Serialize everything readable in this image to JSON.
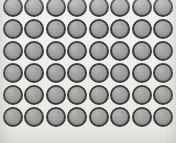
{
  "image": {
    "kind": "photograph",
    "subject": "grid-of-circular-discs",
    "description": "Overhead scanned image of identical gray circular discs arranged in a regular rectangular grid",
    "width_px": 176,
    "height_px": 143
  },
  "canvas": {
    "width": 176,
    "height": 143,
    "background_color": "#f2f2f0",
    "background_color_light": "#f4f4f2",
    "background_color_dark": "#e9e9e6"
  },
  "grid": {
    "columns": 8,
    "rows": 6,
    "total_visible_discs": 48,
    "column_pitch_px": 21.5,
    "row_pitch_px": 22.2,
    "origin_x_px": 3,
    "origin_y_px": -3,
    "top_row_clipped": true,
    "bottom_row_clipped": true,
    "left_margin_px": 3,
    "right_margin_px": 8
  },
  "disc": {
    "label": "circular-disc",
    "diameter_px": 20,
    "fill_color": "#a2a2a0",
    "border_color": "#3b3b3b",
    "border_width_px": 2,
    "highlight_color": "#ffffff",
    "shadow_color": "#000000"
  },
  "discs": [
    {
      "row": 0,
      "col": 0,
      "x": 3,
      "y": -3
    },
    {
      "row": 0,
      "col": 1,
      "x": 24,
      "y": -3
    },
    {
      "row": 0,
      "col": 2,
      "x": 46,
      "y": -3
    },
    {
      "row": 0,
      "col": 3,
      "x": 67,
      "y": -3
    },
    {
      "row": 0,
      "col": 4,
      "x": 89,
      "y": -3
    },
    {
      "row": 0,
      "col": 5,
      "x": 110,
      "y": -3
    },
    {
      "row": 0,
      "col": 6,
      "x": 132,
      "y": -3
    },
    {
      "row": 0,
      "col": 7,
      "x": 153,
      "y": -3
    },
    {
      "row": 1,
      "col": 0,
      "x": 3,
      "y": 19
    },
    {
      "row": 1,
      "col": 1,
      "x": 24,
      "y": 19
    },
    {
      "row": 1,
      "col": 2,
      "x": 46,
      "y": 19
    },
    {
      "row": 1,
      "col": 3,
      "x": 67,
      "y": 19
    },
    {
      "row": 1,
      "col": 4,
      "x": 89,
      "y": 19
    },
    {
      "row": 1,
      "col": 5,
      "x": 110,
      "y": 19
    },
    {
      "row": 1,
      "col": 6,
      "x": 132,
      "y": 19
    },
    {
      "row": 1,
      "col": 7,
      "x": 153,
      "y": 19
    },
    {
      "row": 2,
      "col": 0,
      "x": 3,
      "y": 41
    },
    {
      "row": 2,
      "col": 1,
      "x": 24,
      "y": 41
    },
    {
      "row": 2,
      "col": 2,
      "x": 46,
      "y": 41
    },
    {
      "row": 2,
      "col": 3,
      "x": 67,
      "y": 41
    },
    {
      "row": 2,
      "col": 4,
      "x": 89,
      "y": 41
    },
    {
      "row": 2,
      "col": 5,
      "x": 110,
      "y": 41
    },
    {
      "row": 2,
      "col": 6,
      "x": 132,
      "y": 41
    },
    {
      "row": 2,
      "col": 7,
      "x": 153,
      "y": 41
    },
    {
      "row": 3,
      "col": 0,
      "x": 3,
      "y": 63
    },
    {
      "row": 3,
      "col": 1,
      "x": 24,
      "y": 63
    },
    {
      "row": 3,
      "col": 2,
      "x": 46,
      "y": 63
    },
    {
      "row": 3,
      "col": 3,
      "x": 67,
      "y": 63
    },
    {
      "row": 3,
      "col": 4,
      "x": 89,
      "y": 63
    },
    {
      "row": 3,
      "col": 5,
      "x": 110,
      "y": 63
    },
    {
      "row": 3,
      "col": 6,
      "x": 132,
      "y": 63
    },
    {
      "row": 3,
      "col": 7,
      "x": 153,
      "y": 63
    },
    {
      "row": 4,
      "col": 0,
      "x": 3,
      "y": 85
    },
    {
      "row": 4,
      "col": 1,
      "x": 24,
      "y": 85
    },
    {
      "row": 4,
      "col": 2,
      "x": 46,
      "y": 85
    },
    {
      "row": 4,
      "col": 3,
      "x": 67,
      "y": 85
    },
    {
      "row": 4,
      "col": 4,
      "x": 89,
      "y": 85
    },
    {
      "row": 4,
      "col": 5,
      "x": 110,
      "y": 85
    },
    {
      "row": 4,
      "col": 6,
      "x": 132,
      "y": 85
    },
    {
      "row": 4,
      "col": 7,
      "x": 153,
      "y": 85
    },
    {
      "row": 5,
      "col": 0,
      "x": 3,
      "y": 107
    },
    {
      "row": 5,
      "col": 1,
      "x": 24,
      "y": 107
    },
    {
      "row": 5,
      "col": 2,
      "x": 46,
      "y": 107
    },
    {
      "row": 5,
      "col": 3,
      "x": 67,
      "y": 107
    },
    {
      "row": 5,
      "col": 4,
      "x": 89,
      "y": 107
    },
    {
      "row": 5,
      "col": 5,
      "x": 110,
      "y": 107
    },
    {
      "row": 5,
      "col": 6,
      "x": 132,
      "y": 107
    },
    {
      "row": 5,
      "col": 7,
      "x": 153,
      "y": 107
    }
  ]
}
